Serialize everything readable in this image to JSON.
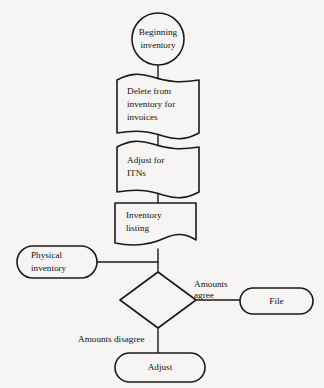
{
  "diagram": {
    "background_color": "#f6f5f3",
    "stroke_color": "#1a1a1a",
    "nodes": [
      {
        "id": "beginning-inventory",
        "shape": "circle",
        "lines": [
          "Beginning",
          "inventory"
        ]
      },
      {
        "id": "delete-from-inventory",
        "shape": "punched-tape",
        "lines": [
          "Delete from",
          "inventory for",
          "invoices"
        ]
      },
      {
        "id": "adjust-for-itns",
        "shape": "punched-tape",
        "lines": [
          "Adjust for",
          "ITNs"
        ]
      },
      {
        "id": "inventory-listing",
        "shape": "document",
        "lines": [
          "Inventory",
          "listing"
        ]
      },
      {
        "id": "physical-inventory",
        "shape": "stadium",
        "lines": [
          "Physical",
          "inventory"
        ]
      },
      {
        "id": "decision",
        "shape": "diamond",
        "lines": []
      },
      {
        "id": "file",
        "shape": "stadium",
        "lines": [
          "File"
        ]
      },
      {
        "id": "adjust",
        "shape": "stadium",
        "lines": [
          "Adjust"
        ]
      }
    ],
    "edge_labels": {
      "amounts_agree_line1": "Amounts",
      "amounts_agree_line2": "agree",
      "amounts_disagree": "Amounts disagree"
    }
  }
}
